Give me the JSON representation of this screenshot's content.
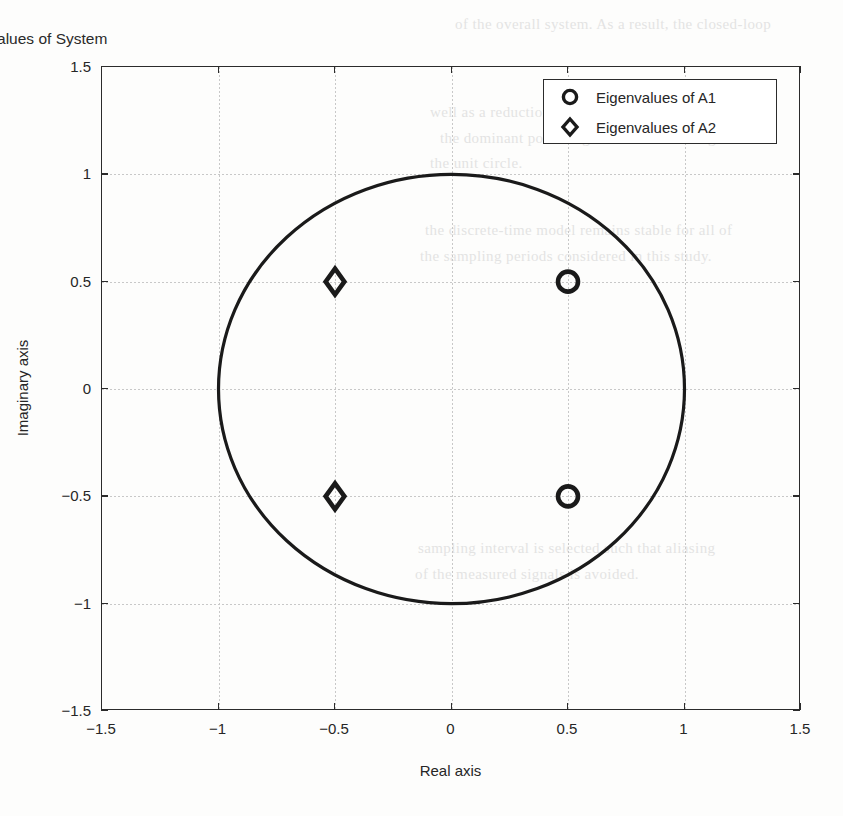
{
  "chart_data": {
    "type": "scatter",
    "title": "Eigenvalues of System",
    "xlabel": "Real axis",
    "ylabel": "Imaginary axis",
    "xlim": [
      -1.5,
      1.5
    ],
    "ylim": [
      -1.5,
      1.5
    ],
    "xticks": [
      "-1.5",
      "-1",
      "-0.5",
      "0",
      "0.5",
      "1",
      "1.5"
    ],
    "xtick_values": [
      -1.5,
      -1,
      -0.5,
      0,
      0.5,
      1,
      1.5
    ],
    "yticks": [
      "1.5",
      "1",
      "0.5",
      "0",
      "-0.5",
      "-1",
      "-1.5"
    ],
    "ytick_values": [
      1.5,
      1,
      0.5,
      0,
      -0.5,
      -1,
      -1.5
    ],
    "grid": true,
    "legend_position": "upper right",
    "series": [
      {
        "name": "Eigenvalues of A1",
        "marker": "circle",
        "color": "#1a1a1a",
        "points": [
          {
            "x": 0.5,
            "y": 0.5
          },
          {
            "x": 0.5,
            "y": -0.5
          }
        ]
      },
      {
        "name": "Eigenvalues of A2",
        "marker": "diamond",
        "color": "#1a1a1a",
        "points": [
          {
            "x": -0.5,
            "y": 0.5
          },
          {
            "x": -0.5,
            "y": -0.5
          }
        ]
      }
    ],
    "reference_curve": {
      "name": "unit-circle",
      "center": [
        0,
        0
      ],
      "radius": 1,
      "color": "#1a1a1a"
    }
  },
  "legend": {
    "entries": [
      {
        "label": "Eigenvalues of A1",
        "marker": "circle"
      },
      {
        "label": "Eigenvalues of A2",
        "marker": "diamond"
      }
    ]
  },
  "background_text": {
    "lines": [
      {
        "text": "of the overall system. As a result, the closed-loop",
        "x": 455,
        "y": 16
      },
      {
        "text": "well as a reduction in the settling time. Note that",
        "x": 430,
        "y": 104
      },
      {
        "text": "the dominant poles migrate toward the origin of",
        "x": 440,
        "y": 130
      },
      {
        "text": "the unit circle.",
        "x": 430,
        "y": 155
      },
      {
        "text": "the discrete-time model remains stable for all of",
        "x": 425,
        "y": 222
      },
      {
        "text": "the sampling periods considered in this study.",
        "x": 420,
        "y": 248
      },
      {
        "text": "sampling interval is selected such that aliasing",
        "x": 418,
        "y": 540
      },
      {
        "text": "of the measured signals is avoided.",
        "x": 415,
        "y": 566
      }
    ]
  }
}
